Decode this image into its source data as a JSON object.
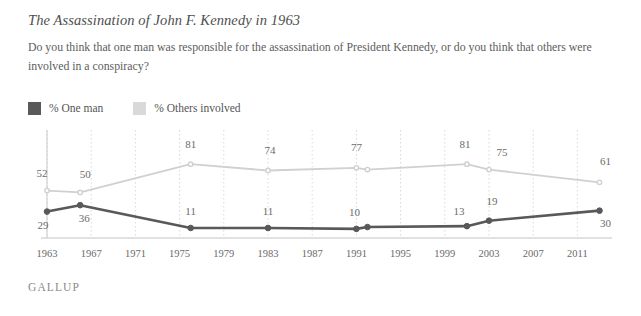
{
  "header": {
    "title": "The Assassination of John F. Kennedy in 1963",
    "subtitle": "Do you think that one man was responsible for the assassination of President Kennedy, or do you think that others were involved in a conspiracy?"
  },
  "legend": {
    "items": [
      {
        "label": "% One man",
        "color": "#595959"
      },
      {
        "label": "% Others involved",
        "color": "#d5d5d5"
      }
    ]
  },
  "footer": {
    "brand": "GALLUP"
  },
  "chart_data": {
    "type": "line",
    "title": "The Assassination of John F. Kennedy in 1963",
    "xlabel": "",
    "ylabel": "",
    "ylim": [
      0,
      90
    ],
    "xlim": [
      1963,
      2014
    ],
    "grid": "vertical-dotted",
    "legend_position": "top-left",
    "xticks": [
      1963,
      1967,
      1971,
      1975,
      1979,
      1983,
      1987,
      1991,
      1995,
      1999,
      2003,
      2007,
      2011
    ],
    "series": [
      {
        "name": "% One man",
        "color": "#595959",
        "points": [
          {
            "x": 1963,
            "y": 29,
            "label": "29"
          },
          {
            "x": 1966,
            "y": 36,
            "label": "36"
          },
          {
            "x": 1976,
            "y": 11,
            "label": "11"
          },
          {
            "x": 1983,
            "y": 11,
            "label": "11"
          },
          {
            "x": 1991,
            "y": 10,
            "label": "10"
          },
          {
            "x": 1992,
            "y": 12,
            "label": ""
          },
          {
            "x": 2001,
            "y": 13,
            "label": "13"
          },
          {
            "x": 2003,
            "y": 19,
            "label": "19"
          },
          {
            "x": 2013,
            "y": 30,
            "label": "30"
          }
        ]
      },
      {
        "name": "% Others involved",
        "color": "#d0d0d0",
        "points": [
          {
            "x": 1963,
            "y": 52,
            "label": "52"
          },
          {
            "x": 1966,
            "y": 50,
            "label": "50"
          },
          {
            "x": 1976,
            "y": 81,
            "label": "81"
          },
          {
            "x": 1983,
            "y": 74,
            "label": "74"
          },
          {
            "x": 1991,
            "y": 77,
            "label": "77"
          },
          {
            "x": 1992,
            "y": 75,
            "label": ""
          },
          {
            "x": 2001,
            "y": 81,
            "label": "81"
          },
          {
            "x": 2003,
            "y": 75,
            "label": "75"
          },
          {
            "x": 2013,
            "y": 61,
            "label": "61"
          }
        ]
      }
    ]
  }
}
